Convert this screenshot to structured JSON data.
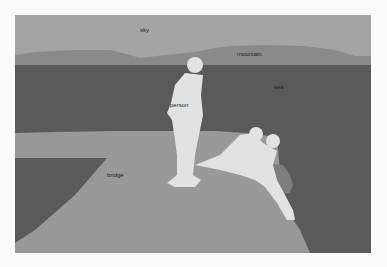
{
  "image": {
    "type": "segmentation-mask",
    "colors": {
      "sky": "#a4a4a4",
      "mountain": "#8a8a8a",
      "sea": "#5a5a5a",
      "bridge": "#999999",
      "bridge_shadow": "#868686",
      "person": "#e2e2e2",
      "rock": "#7e7e7e"
    }
  },
  "labels": {
    "sky": "sky",
    "mountain": "mountain",
    "sea": "sea",
    "person": "person",
    "bridge": "bridge"
  }
}
